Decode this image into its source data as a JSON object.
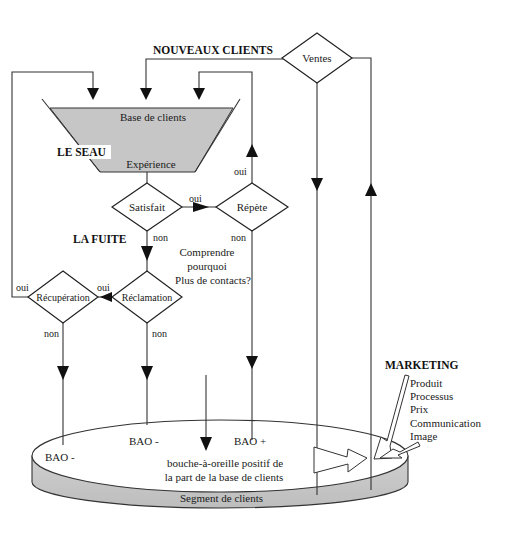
{
  "labels": {
    "new_clients": "NOUVEAUX CLIENTS",
    "bucket": "LE SEAU",
    "leak": "LA FUITE",
    "marketing": "MARKETING"
  },
  "funnel": {
    "top_label": "Base de clients",
    "bottom_label": "Expérience"
  },
  "decisions": {
    "sales": "Ventes",
    "satisfied": "Satisfait",
    "repeat": "Répète",
    "complaint": "Réclamation",
    "recovery": "Récupération"
  },
  "edge_labels": {
    "satisfied_yes": "oui",
    "satisfied_no": "non",
    "repeat_yes": "oui",
    "repeat_no": "non",
    "complaint_yes": "oui",
    "complaint_no": "non",
    "recovery_yes": "oui",
    "recovery_no": "non"
  },
  "note": [
    "Comprendre",
    "pourquoi",
    "Plus de contacts?"
  ],
  "marketing_items": [
    "Produit",
    "Processus",
    "Prix",
    "Communication",
    "Image"
  ],
  "segment": {
    "label": "Segment de clients",
    "wom_neg_1": "BAO -",
    "wom_neg_2": "BAO -",
    "wom_pos": "BAO +",
    "wom": "BAO",
    "wom_text": [
      "bouche-à-oreille positif de",
      "la part de la base de clients"
    ]
  },
  "colors": {
    "fill_gray": "#c8c8c8",
    "line": "#333333"
  }
}
